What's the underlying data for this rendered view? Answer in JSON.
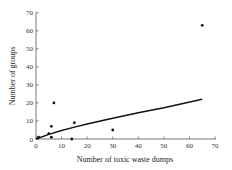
{
  "chart_data": {
    "type": "scatter",
    "title": "",
    "xlabel": "Number of toxic waste dumps",
    "ylabel": "Number of groups",
    "xlim": [
      0,
      70
    ],
    "ylim": [
      0,
      70
    ],
    "xticks": [
      0,
      10,
      20,
      30,
      40,
      50,
      60,
      70
    ],
    "yticks": [
      0,
      10,
      20,
      30,
      40,
      50,
      60,
      70
    ],
    "grid": false,
    "legend": null,
    "points": [
      {
        "x": 1,
        "y": 1
      },
      {
        "x": 5,
        "y": 3
      },
      {
        "x": 6,
        "y": 1
      },
      {
        "x": 6,
        "y": 7
      },
      {
        "x": 7,
        "y": 20
      },
      {
        "x": 14,
        "y": 0
      },
      {
        "x": 15,
        "y": 9
      },
      {
        "x": 30,
        "y": 5
      },
      {
        "x": 65,
        "y": 63
      }
    ],
    "fit_curve": {
      "type": "line",
      "description": "concave fitted curve",
      "x": [
        0,
        5,
        10,
        15,
        20,
        30,
        40,
        50,
        65
      ],
      "y": [
        0,
        2.6,
        4.7,
        6.6,
        8.3,
        11.5,
        14.5,
        17.3,
        22
      ]
    }
  }
}
